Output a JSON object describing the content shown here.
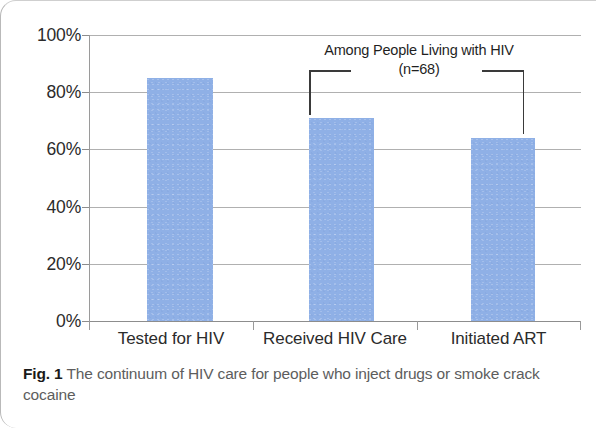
{
  "figure": {
    "caption_label": "Fig. 1",
    "caption_text": "The continuum of HIV care for people who inject drugs or smoke crack cocaine"
  },
  "annotation": {
    "line1": "Among People Living with HIV",
    "line2": "(n=68)",
    "spans_categories": [
      "Received HIV Care",
      "Initiated ART"
    ]
  },
  "colors": {
    "bar_fill": "#8fb0e6",
    "gridline": "#b0b0b0",
    "axis": "#8d8d8d",
    "tick_text": "#2b2b2b",
    "caption_text": "#5d5d5d",
    "caption_label": "#1a1a1a",
    "bracket": "#3a3a3a"
  },
  "chart_data": {
    "type": "bar",
    "title": "",
    "subtitle": "",
    "xlabel": "",
    "ylabel": "",
    "categories": [
      "Tested for HIV",
      "Received HIV Care",
      "Initiated ART"
    ],
    "values": [
      85,
      71,
      64
    ],
    "series": [
      {
        "name": "HIV care continuum",
        "values": [
          85,
          71,
          64
        ]
      }
    ],
    "ylim": [
      0,
      100
    ],
    "ytick_values": [
      0,
      20,
      40,
      60,
      80,
      100
    ],
    "ytick_labels": [
      "0%",
      "20%",
      "40%",
      "60%",
      "80%",
      "100%"
    ],
    "grid": true,
    "grid_axis": "y",
    "legend": false,
    "legend_position": "none",
    "annotations": [
      {
        "text": "Among People Living with HIV (n=68)",
        "type": "bracket",
        "from_category": "Received HIV Care",
        "to_category": "Initiated ART"
      }
    ]
  }
}
